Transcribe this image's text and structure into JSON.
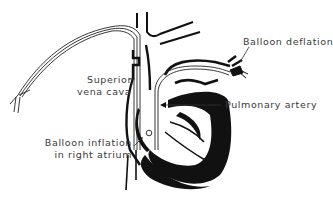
{
  "diagram": {
    "colors": {
      "ink": "#111111",
      "label_text": "#3a3a3a",
      "background": "#ffffff"
    },
    "labels": {
      "balloon_deflation": "Balloon deflation",
      "superior_vena_cava_line1": "Superior",
      "superior_vena_cava_line2": "vena cava",
      "pulmonary_artery": "Pulmonary artery",
      "balloon_inflation_line1": "Balloon inflation",
      "balloon_inflation_line2": "in right atrium"
    }
  }
}
